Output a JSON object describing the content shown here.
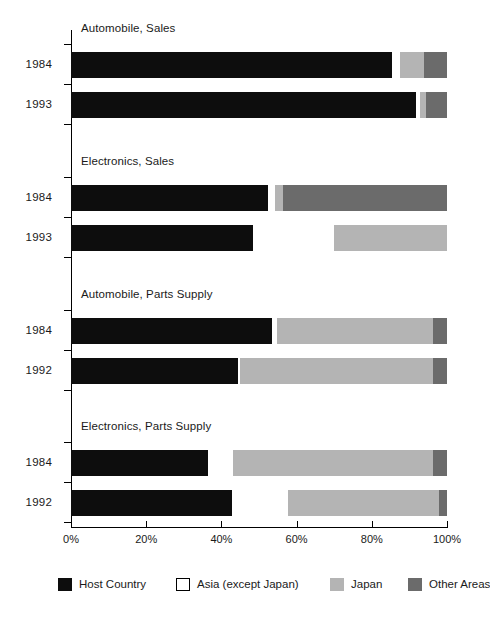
{
  "chart_data": {
    "type": "bar",
    "orientation": "horizontal",
    "stacked": true,
    "title": "",
    "xlabel": "",
    "ylabel": "",
    "xlim": [
      0,
      100
    ],
    "grid": false,
    "legend_position": "bottom",
    "tick_labels": [
      "0%",
      "20%",
      "40%",
      "60%",
      "80%",
      "100%"
    ],
    "tick_values": [
      0,
      20,
      40,
      60,
      80,
      100
    ],
    "series": [
      {
        "name": "Host Country",
        "color": "#0d0d0d"
      },
      {
        "name": "Asia (except Japan)",
        "color": "#ffffff"
      },
      {
        "name": "Japan",
        "color": "#b4b4b4"
      },
      {
        "name": "Other Areas",
        "color": "#6b6b6b"
      }
    ],
    "groups": [
      {
        "title": "Automobile, Sales",
        "bars": [
          {
            "category": "1984",
            "values": [
              85.5,
              2.0,
              6.5,
              6.0
            ]
          },
          {
            "category": "1993",
            "values": [
              91.8,
              1.0,
              1.5,
              5.7
            ]
          }
        ]
      },
      {
        "title": "Electronics, Sales",
        "bars": [
          {
            "category": "1984",
            "values": [
              52.5,
              1.8,
              2.2,
              43.5
            ]
          },
          {
            "category": "1993",
            "values": [
              48.5,
              21.5,
              30.0,
              0.0
            ]
          }
        ]
      },
      {
        "title": "Automobile, Parts Supply",
        "bars": [
          {
            "category": "1984",
            "values": [
              53.5,
              1.3,
              41.5,
              3.7
            ]
          },
          {
            "category": "1992",
            "values": [
              44.5,
              0.5,
              51.3,
              3.7
            ]
          }
        ]
      },
      {
        "title": "Electronics, Parts Supply",
        "bars": [
          {
            "category": "1984",
            "values": [
              36.4,
              6.6,
              53.2,
              3.8
            ]
          },
          {
            "category": "1992",
            "values": [
              42.8,
              14.9,
              40.2,
              2.1
            ]
          }
        ]
      }
    ]
  },
  "legend": {
    "items": [
      {
        "label": "Host Country",
        "swatch": "sw-host"
      },
      {
        "label": "Asia (except Japan)",
        "swatch": "sw-asia"
      },
      {
        "label": "Japan",
        "swatch": "sw-japan"
      },
      {
        "label": "Other Areas",
        "swatch": "sw-other"
      }
    ]
  }
}
